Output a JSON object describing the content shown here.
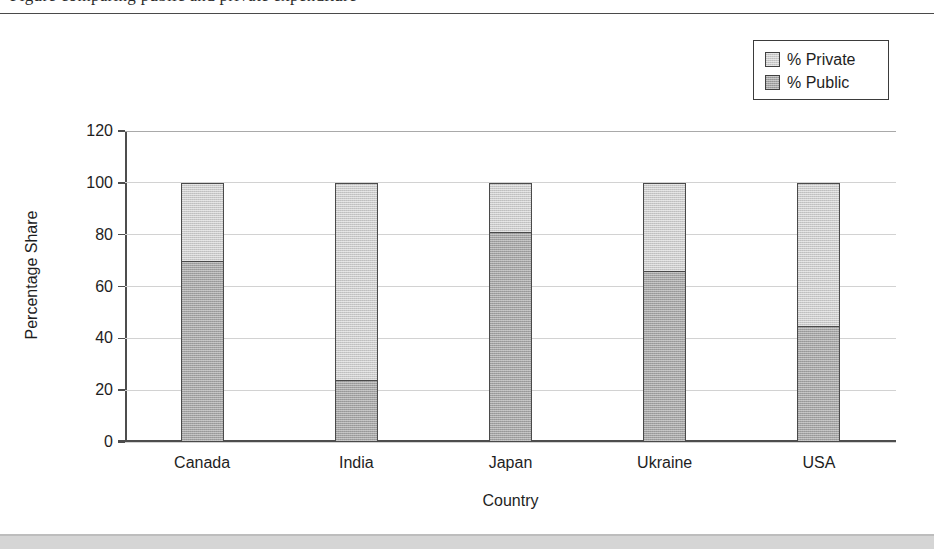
{
  "page": {
    "clipped_top_text": "Figure comparing public and private expenditure",
    "background_color": "#ffffff",
    "bottom_band_color": "#d5d5d5",
    "rule_color": "#4a4a4a"
  },
  "legend": {
    "position": "top-right",
    "entries": [
      {
        "label": "% Private",
        "color": "#cacaca",
        "swatch_name": "legend-swatch-private"
      },
      {
        "label": "% Public",
        "color": "#a3a3a3",
        "swatch_name": "legend-swatch-public"
      }
    ]
  },
  "chart_data": {
    "type": "bar",
    "subtype": "stacked",
    "title": "",
    "xlabel": "Country",
    "ylabel": "Percentage Share",
    "categories": [
      "Canada",
      "India",
      "Japan",
      "Ukraine",
      "USA"
    ],
    "series": [
      {
        "name": "% Public",
        "color": "#a3a3a3",
        "values": [
          70,
          24,
          81,
          66,
          45
        ]
      },
      {
        "name": "% Private",
        "color": "#cacaca",
        "values": [
          30,
          76,
          19,
          34,
          55
        ]
      }
    ],
    "ylim": [
      0,
      120
    ],
    "ytick_values": [
      0,
      20,
      40,
      60,
      80,
      100,
      120
    ],
    "ytick_labels": [
      "0",
      "20",
      "40",
      "60",
      "80",
      "100",
      "120"
    ],
    "grid": true,
    "grid_axis": "y",
    "legend_position": "upper right",
    "totals": [
      100,
      100,
      100,
      100,
      100
    ]
  }
}
